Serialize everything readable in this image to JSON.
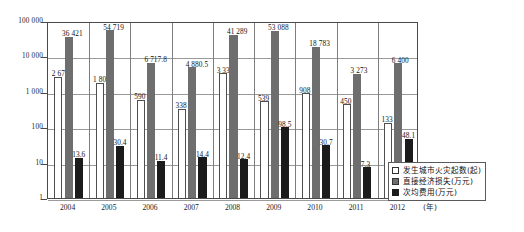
{
  "chart_data": {
    "type": "bar",
    "title": "",
    "subtitle": "",
    "xlabel": "年",
    "ylabel": "",
    "categories": [
      "2004",
      "2005",
      "2006",
      "2007",
      "2008",
      "2009",
      "2010",
      "2011",
      "2012"
    ],
    "x_unit_label": "(年)",
    "yscale": "log",
    "ylim": [
      1,
      100000
    ],
    "ytick_labels": [
      "100 000",
      "10 000",
      "1 000",
      "100",
      "10",
      "1"
    ],
    "ytick_values": [
      100000,
      10000,
      1000,
      100,
      10,
      1
    ],
    "grid": true,
    "legend_position": "inside-bottom-right",
    "series": [
      {
        "name": "发生城市火灾起数(起)",
        "color": "#ffffff",
        "values": [
          2679,
          1802,
          590,
          338,
          3336,
          539,
          908,
          450,
          133
        ],
        "labels": [
          "2 679",
          "1 802",
          "590",
          "338",
          "3 336",
          "539",
          "908",
          "450",
          "133"
        ]
      },
      {
        "name": "直接经济损失(万元)",
        "color": "#6e6e6e",
        "values": [
          36421,
          54719,
          6717.8,
          4880.5,
          41289,
          53088,
          18783,
          3273,
          6400
        ],
        "labels": [
          "36 421",
          "54 719",
          "6 717.8",
          "4 880.5",
          "41 289",
          "53 088",
          "18 783",
          "3 273",
          "6 400"
        ]
      },
      {
        "name": "次均费用(万元)",
        "color": "#1b1b1b",
        "values": [
          13.6,
          30.4,
          11.4,
          14.4,
          12.4,
          98.5,
          30.7,
          7.3,
          48.1
        ],
        "labels": [
          "13.6",
          "30.4",
          "11.4",
          "14.4",
          "12.4",
          "98.5",
          "30.7",
          "7.3",
          "48.1"
        ]
      }
    ]
  },
  "legend": {
    "items": [
      {
        "label": "发生城市火灾起数(起)",
        "swatch": "hollow-square-icon"
      },
      {
        "label": "直接经济损失(万元)",
        "swatch": "grey-square-icon"
      },
      {
        "label": "次均费用(万元)",
        "swatch": "black-square-icon"
      }
    ]
  }
}
